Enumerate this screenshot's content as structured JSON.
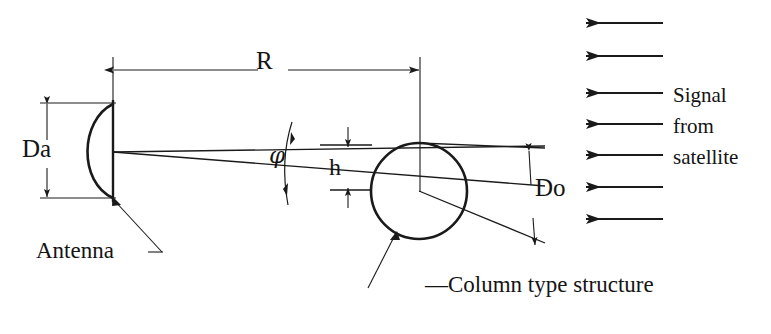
{
  "figure": {
    "background_color": "#ffffff",
    "line_color": "#1a1a1a",
    "labels": {
      "R": "R",
      "Da": "Da",
      "phi": "φ",
      "h": "h",
      "Do": "Do",
      "antenna": "Antenna",
      "column": "—Column type structure",
      "signal_line1": "Signal",
      "signal_line2": "from",
      "signal_line3": "satellite"
    },
    "elements": {
      "antenna_dish": "parabolic-dish",
      "structure": "circle",
      "beam": "two-divergent-rays",
      "signal_arrows_count": 7
    },
    "dimensions": [
      {
        "name": "R",
        "label": "R",
        "orientation": "horizontal",
        "description": "distance from antenna to structure"
      },
      {
        "name": "Da",
        "label": "Da",
        "orientation": "vertical",
        "description": "antenna diameter"
      },
      {
        "name": "h",
        "label": "h",
        "orientation": "vertical",
        "description": "beam offset height"
      },
      {
        "name": "Do",
        "label": "Do",
        "orientation": "vertical",
        "description": "structure diameter"
      },
      {
        "name": "phi",
        "label": "φ",
        "orientation": "arc",
        "description": "beam divergence angle"
      }
    ]
  }
}
